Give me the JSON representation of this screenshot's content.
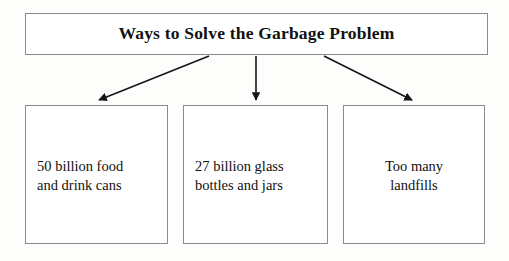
{
  "diagram": {
    "type": "hierarchy-flowchart",
    "title_node": {
      "label": "Ways to Solve the Garbage Problem"
    },
    "children": [
      {
        "label": "50 billion food and drink cans",
        "line_1": "50 billion food",
        "line_2": "and drink cans",
        "align": "left"
      },
      {
        "label": "27 billion glass bottles and jars",
        "line_1": "27 billion glass",
        "line_2": "bottles and jars",
        "align": "left"
      },
      {
        "label": "Too many landfills",
        "line_1": "Too many",
        "line_2": "landfills",
        "align": "center"
      }
    ],
    "connectors": [
      {
        "name": "arrow-to-child-0",
        "direction": "down-left"
      },
      {
        "name": "arrow-to-child-1",
        "direction": "down"
      },
      {
        "name": "arrow-to-child-2",
        "direction": "down-right"
      }
    ],
    "colors": {
      "page_background": "#fdfdfc",
      "box_fill": "#ffffff",
      "box_border": "#8b8b8b",
      "text": "#111111",
      "arrow": "#171717"
    }
  }
}
